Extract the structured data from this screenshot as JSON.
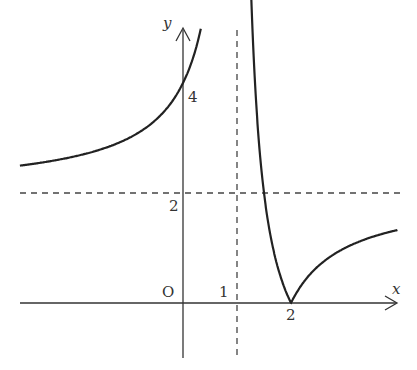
{
  "figure": {
    "function": "y = |2(x-2)/(x-1)|",
    "axes": {
      "x_label": "x",
      "y_label": "y",
      "origin_label": "O"
    },
    "ticks": {
      "x": [
        "1",
        "2"
      ],
      "y": [
        "2",
        "4"
      ]
    },
    "asymptotes": {
      "vertical": "x = 1",
      "horizontal": "y = 2"
    },
    "colors": {
      "curve": "#222222",
      "axes": "#333333",
      "dashed": "#444444"
    }
  },
  "chart_data": {
    "type": "line",
    "title": "",
    "xlabel": "x",
    "ylabel": "y",
    "series": [
      {
        "name": "left branch",
        "x": [
          -3,
          -2,
          -1,
          0,
          0.3
        ],
        "y": [
          2.5,
          2.67,
          3,
          4,
          4.86
        ]
      },
      {
        "name": "right branch",
        "x": [
          1.3,
          1.5,
          2,
          3,
          3.96
        ],
        "y": [
          4.67,
          2,
          0,
          1,
          1.32
        ]
      }
    ],
    "asymptotes": {
      "x": 1,
      "y": 2
    },
    "xlim": [
      -3.4,
      4.1
    ],
    "ylim": [
      -1,
      5.5
    ],
    "grid": false
  }
}
